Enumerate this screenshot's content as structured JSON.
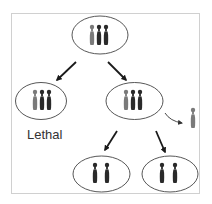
{
  "diagram": {
    "type": "chromosome-segregation",
    "colors": {
      "frame": "#d0d0d0",
      "cell_outline": "#444444",
      "chromosome_dark": "#2a2a2a",
      "chromosome_gray": "#7a7a7a",
      "arrow": "#1a1a1a"
    },
    "cells": [
      {
        "id": "parent",
        "chromosomes": [
          "gray",
          "dark",
          "dark"
        ]
      },
      {
        "id": "left-child",
        "chromosomes": [
          "gray",
          "dark",
          "dark"
        ]
      },
      {
        "id": "right-child",
        "chromosomes": [
          "gray",
          "dark",
          "dark"
        ]
      },
      {
        "id": "bottom-left",
        "chromosomes": [
          "dark",
          "dark"
        ]
      },
      {
        "id": "bottom-right",
        "chromosomes": [
          "dark",
          "dark"
        ]
      }
    ],
    "expelled_chromosome": "gray",
    "labels": {
      "lethal": "Lethal"
    }
  }
}
